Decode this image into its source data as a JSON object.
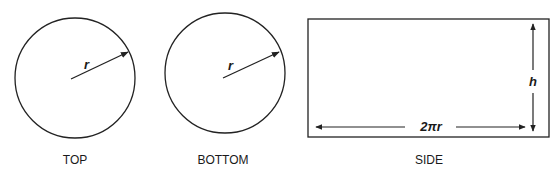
{
  "diagram": {
    "stroke_color": "#222222",
    "parts": [
      {
        "id": "top",
        "shape": "circle",
        "caption": "TOP",
        "radius_label": "r",
        "center": [
          75,
          78
        ],
        "radius": 60
      },
      {
        "id": "bottom",
        "shape": "circle",
        "caption": "BOTTOM",
        "radius_label": "r",
        "center": [
          225,
          73
        ],
        "radius": 60
      },
      {
        "id": "side",
        "shape": "rectangle",
        "caption": "SIDE",
        "width_label": "2πr",
        "height_label": "h"
      }
    ]
  }
}
